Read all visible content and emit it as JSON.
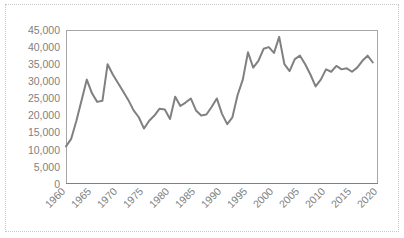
{
  "chart_data": {
    "type": "line",
    "title": "",
    "subtitle": "",
    "xlabel": "",
    "ylabel": "",
    "xlim": [
      1960,
      2020
    ],
    "ylim": [
      0,
      45000
    ],
    "xticks": [
      "1960",
      "1965",
      "1970",
      "1975",
      "1980",
      "1985",
      "1990",
      "1995",
      "2000",
      "2005",
      "2010",
      "2015",
      "2020"
    ],
    "xtick_values": [
      1960,
      1965,
      1970,
      1975,
      1980,
      1985,
      1990,
      1995,
      2000,
      2005,
      2010,
      2015,
      2020
    ],
    "yticks": [
      "0",
      "5,000",
      "10,000",
      "15,000",
      "20,000",
      "25,000",
      "30,000",
      "35,000",
      "40,000",
      "45,000"
    ],
    "ytick_values": [
      0,
      5000,
      10000,
      15000,
      20000,
      25000,
      30000,
      35000,
      40000,
      45000
    ],
    "grid": false,
    "legend": false,
    "legend_position": "none",
    "line_color": "#808080",
    "axis_color": "#808080",
    "plot_border_color": "#a6a6a6",
    "tick_label_color": "#7f7f7f",
    "background_color": "#ffffff",
    "x": [
      1960,
      1961,
      1962,
      1963,
      1964,
      1965,
      1966,
      1967,
      1968,
      1969,
      1970,
      1971,
      1972,
      1973,
      1974,
      1975,
      1976,
      1977,
      1978,
      1979,
      1980,
      1981,
      1982,
      1983,
      1984,
      1985,
      1986,
      1987,
      1988,
      1989,
      1990,
      1991,
      1992,
      1993,
      1994,
      1995,
      1996,
      1997,
      1998,
      1999,
      2000,
      2001,
      2002,
      2003,
      2004,
      2005,
      2006,
      2007,
      2008,
      2009,
      2010,
      2011,
      2012,
      2013,
      2014,
      2015,
      2016,
      2017,
      2018,
      2019
    ],
    "series": [
      {
        "name": "",
        "values": [
          11000,
          13200,
          18500,
          24500,
          30500,
          26500,
          24000,
          24300,
          35000,
          32000,
          29500,
          27000,
          24500,
          21500,
          19500,
          16200,
          18500,
          20000,
          22000,
          21800,
          19000,
          25500,
          22800,
          23800,
          25000,
          21500,
          20000,
          20300,
          22500,
          25000,
          20500,
          17500,
          19500,
          26000,
          30500,
          38500,
          34000,
          36000,
          39500,
          40000,
          38300,
          43000,
          35000,
          33000,
          36500,
          37500,
          35000,
          32000,
          28500,
          30500,
          33500,
          32800,
          34500,
          33500,
          33800,
          32800,
          34000,
          36000,
          37500,
          35500
        ]
      }
    ]
  }
}
